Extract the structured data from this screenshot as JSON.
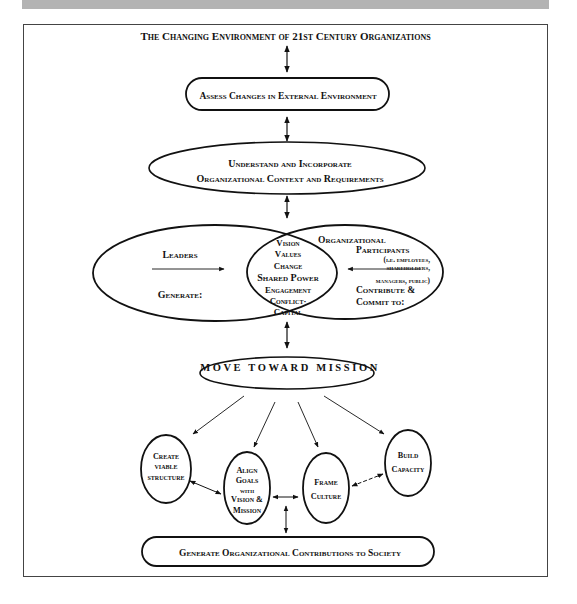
{
  "figure": {
    "title": "The Changing Environment of 21st Century Organizations",
    "nodes": {
      "assess": "Assess Changes in External Environment",
      "understand_line1": "Understand and Incorporate",
      "understand_line2": "Organizational Context and Requirements",
      "leaders": "Leaders",
      "leaders_generate": "Generate:",
      "core_items": [
        "Vision",
        "Values",
        "Change",
        "Shared Power",
        "Engagement",
        "Conflict·",
        "Capital"
      ],
      "participants_line1": "Organizational",
      "participants_line2": "Participants",
      "participants_note1": "(i.e. employees,",
      "participants_note2": "shareholders,",
      "participants_note3": "managers, public)",
      "participants_contribute1": "Contribute &",
      "participants_contribute2": "Commit to:",
      "move": "Move Toward Mission",
      "create_line1": "Create",
      "create_line2": "viable",
      "create_line3": "structure",
      "align_line1": "Align",
      "align_line2": "Goals",
      "align_line3": "with",
      "align_line4": "Vision &",
      "align_line5": "Mission",
      "frame_line1": "Frame",
      "frame_line2": "Culture",
      "build_line1": "Build",
      "build_line2": "Capacity",
      "generate_contrib": "Generate Organizational Contributions to Society"
    }
  },
  "colors": {
    "stroke": "#111111",
    "topbar": "#b3b3b3",
    "frame": "#444444"
  }
}
